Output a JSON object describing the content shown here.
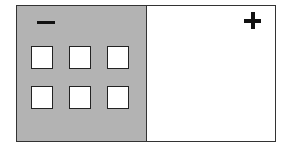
{
  "diagram": {
    "left_panel": {
      "symbol": "−",
      "symbol_name": "minus",
      "fill_color": "#b3b3b3",
      "squares": {
        "rows": 2,
        "cols": 3,
        "fill_color": "#ffffff"
      }
    },
    "right_panel": {
      "symbol": "+",
      "symbol_name": "plus",
      "fill_color": "#ffffff"
    },
    "border_color": "#333333"
  }
}
